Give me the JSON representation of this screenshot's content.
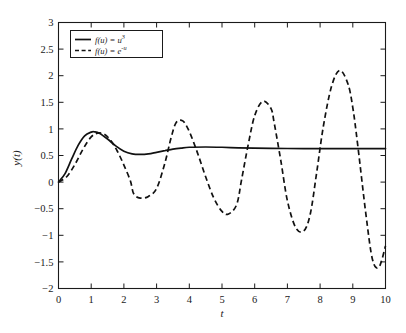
{
  "chart_data": {
    "type": "line",
    "title": "",
    "xlabel": "t",
    "ylabel": "y(t)",
    "xlim": [
      0,
      10
    ],
    "ylim": [
      -2,
      3
    ],
    "grid": false,
    "legend_position": "top-left",
    "xticks": [
      "0",
      "1",
      "2",
      "3",
      "4",
      "5",
      "6",
      "7",
      "8",
      "9",
      "10"
    ],
    "yticks": [
      "-2",
      "-1.5",
      "-1",
      "-0.5",
      "0",
      "0.5",
      "1",
      "1.5",
      "2",
      "2.5",
      "3"
    ],
    "series": [
      {
        "name": "f(u) = u^3",
        "legend_main": "f(u) = u",
        "legend_exponent": "3",
        "style": "solid",
        "color": "#111111",
        "x": [
          0,
          0.2,
          0.4,
          0.6,
          0.8,
          1.0,
          1.1,
          1.25,
          1.5,
          1.75,
          2.0,
          2.25,
          2.5,
          2.75,
          3.0,
          3.25,
          3.5,
          3.75,
          4.0,
          4.5,
          5.0,
          5.5,
          6.0,
          6.5,
          7.0,
          7.5,
          8.0,
          8.5,
          9.0,
          9.5,
          10.0
        ],
        "values": [
          0,
          0.16,
          0.43,
          0.69,
          0.87,
          0.94,
          0.945,
          0.92,
          0.81,
          0.68,
          0.58,
          0.53,
          0.52,
          0.53,
          0.56,
          0.59,
          0.62,
          0.64,
          0.655,
          0.66,
          0.655,
          0.645,
          0.638,
          0.634,
          0.632,
          0.631,
          0.631,
          0.631,
          0.631,
          0.631,
          0.631
        ]
      },
      {
        "name": "f(u) = e^-u",
        "legend_main": "f(u) = e",
        "legend_exponent": "-u",
        "style": "dashed",
        "color": "#111111",
        "x": [
          0,
          0.25,
          0.5,
          0.75,
          1.0,
          1.2,
          1.4,
          1.6,
          1.8,
          2.0,
          2.2,
          2.3,
          2.5,
          2.75,
          3.0,
          3.25,
          3.45,
          3.6,
          3.8,
          4.0,
          4.25,
          4.5,
          4.75,
          5.0,
          5.2,
          5.45,
          5.6,
          5.8,
          6.0,
          6.25,
          6.5,
          6.6,
          6.8,
          7.0,
          7.25,
          7.5,
          7.7,
          7.9,
          8.1,
          8.35,
          8.6,
          8.85,
          9.0,
          9.15,
          9.4,
          9.6,
          9.8,
          10.0
        ],
        "values": [
          0,
          0.1,
          0.33,
          0.62,
          0.85,
          0.92,
          0.9,
          0.78,
          0.58,
          0.32,
          0.02,
          -0.22,
          -0.3,
          -0.27,
          -0.12,
          0.35,
          0.85,
          1.12,
          1.15,
          0.95,
          0.55,
          0.1,
          -0.3,
          -0.55,
          -0.6,
          -0.42,
          0.05,
          0.7,
          1.25,
          1.52,
          1.38,
          1.1,
          0.4,
          -0.35,
          -0.85,
          -0.92,
          -0.6,
          0.2,
          1.05,
          1.8,
          2.1,
          1.85,
          1.4,
          0.7,
          -0.6,
          -1.45,
          -1.6,
          -1.2
        ]
      }
    ]
  },
  "legend": {
    "entries": [
      {
        "label_main": "f(u) = u",
        "exponent": "3"
      },
      {
        "label_main": "f(u) = e",
        "exponent": "-u"
      }
    ]
  },
  "axes": {
    "x_title": "t",
    "y_title": "y(t)"
  }
}
